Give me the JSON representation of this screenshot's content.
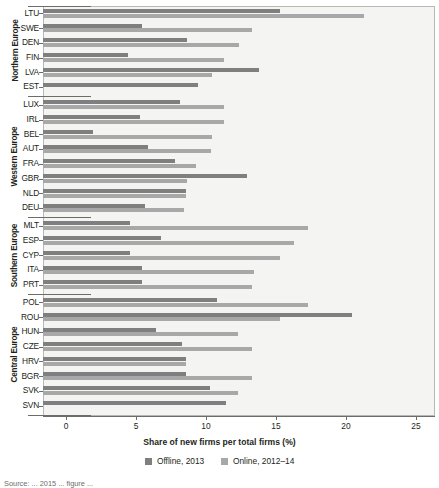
{
  "chart_data": {
    "type": "bar",
    "orientation": "horizontal",
    "title": "",
    "xlabel": "Share of new firms per total firms (%)",
    "ylabel": "",
    "xlim": [
      0,
      25
    ],
    "xticks": [
      0,
      5,
      10,
      15,
      20,
      25
    ],
    "grid": false,
    "legend_position": "bottom",
    "legend": [
      {
        "name": "Offline, 2013",
        "color": "#7f7f7f"
      },
      {
        "name": "Online, 2012–14",
        "color": "#a8a8a8"
      }
    ],
    "series": [
      {
        "name": "Offline, 2013",
        "key": "offline",
        "color": "#7f7f7f"
      },
      {
        "name": "Online, 2012–14",
        "key": "online",
        "color": "#a8a8a8"
      }
    ],
    "groups": [
      {
        "label": "Northern Europe",
        "categories": [
          "LTU",
          "SWE",
          "DEN",
          "FIN",
          "LVA",
          "EST"
        ],
        "offline": [
          16.9,
          7.1,
          10.3,
          6.1,
          15.4,
          11.1
        ],
        "online": [
          22.9,
          14.9,
          14.0,
          12.9,
          12.1,
          null
        ]
      },
      {
        "label": "Western Europe",
        "categories": [
          "LUX",
          "IRL",
          "BEL",
          "AUT",
          "FRA",
          "GBR",
          "NLD",
          "DEU"
        ],
        "offline": [
          9.8,
          6.9,
          3.6,
          7.5,
          9.4,
          14.6,
          10.2,
          7.3
        ],
        "online": [
          12.9,
          12.9,
          12.1,
          12.0,
          10.9,
          10.3,
          10.2,
          10.1
        ]
      },
      {
        "label": "Southern Europe",
        "categories": [
          "MLT",
          "ESP",
          "CYP",
          "ITA",
          "PRT"
        ],
        "offline": [
          6.2,
          8.4,
          6.2,
          7.1,
          7.1
        ],
        "online": [
          18.9,
          17.9,
          16.9,
          15.1,
          14.9
        ]
      },
      {
        "label": "Central Europe",
        "categories": [
          "POL",
          "ROU",
          "HUN",
          "CZE",
          "HRV",
          "BGR",
          "SVK",
          "SVN"
        ],
        "offline": [
          12.4,
          22.1,
          8.1,
          9.9,
          10.2,
          10.2,
          11.9,
          13.1
        ],
        "online": [
          18.9,
          16.9,
          13.9,
          14.9,
          10.2,
          14.9,
          13.9,
          null
        ]
      }
    ]
  },
  "footer": {
    "source": "Source: ... 2015 ... figure ..."
  }
}
